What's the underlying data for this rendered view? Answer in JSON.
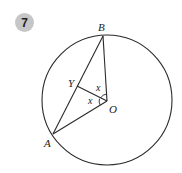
{
  "question_number": "7",
  "diagram": {
    "type": "circle-geometry",
    "circle": {
      "center": "O"
    },
    "points": {
      "A": {
        "label": "A"
      },
      "B": {
        "label": "B"
      },
      "O": {
        "label": "O"
      },
      "Y": {
        "label": "Y"
      }
    },
    "segments": [
      "AB",
      "BO",
      "AO",
      "YO"
    ],
    "angles": [
      {
        "name": "angle-YOB",
        "label": "x"
      },
      {
        "name": "angle-YOA",
        "label": "x"
      }
    ]
  },
  "colors": {
    "badge_bg": "#c6c6c6",
    "stroke": "#2a2a2a"
  }
}
